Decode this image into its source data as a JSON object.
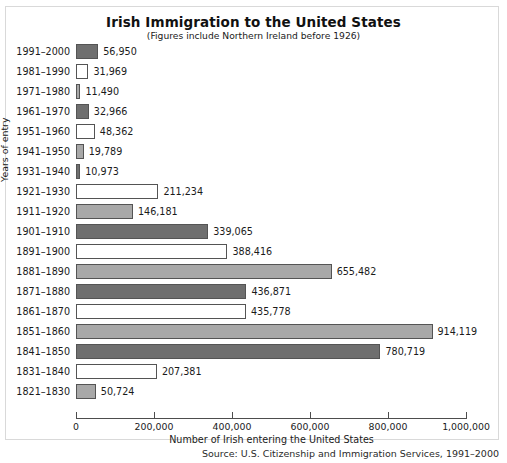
{
  "chart_data": {
    "type": "bar",
    "orientation": "horizontal",
    "title": "Irish Immigration to the United States",
    "subtitle": "(Figures include Northern Ireland before 1926)",
    "xlabel": "Number of Irish entering the United States",
    "ylabel": "Years of entry",
    "xlim": [
      0,
      1000000
    ],
    "grid": false,
    "legend": "none",
    "xticks": [
      0,
      200000,
      400000,
      600000,
      800000,
      1000000
    ],
    "xtick_labels": [
      "0",
      "200,000",
      "400,000",
      "600,000",
      "800,000",
      "1,000,000"
    ],
    "categories": [
      "1991–2000",
      "1981–1990",
      "1971–1980",
      "1961–1970",
      "1951–1960",
      "1941–1950",
      "1931–1940",
      "1921–1930",
      "1911–1920",
      "1901–1910",
      "1891–1900",
      "1881–1890",
      "1871–1880",
      "1861–1870",
      "1851–1860",
      "1841–1850",
      "1831–1840",
      "1821–1830"
    ],
    "values": [
      56950,
      31969,
      11490,
      32966,
      48362,
      19789,
      10973,
      211234,
      146181,
      339065,
      388416,
      655482,
      436871,
      435778,
      914119,
      780719,
      207381,
      50724
    ],
    "value_labels": [
      "56,950",
      "31,969",
      "11,490",
      "32,966",
      "48,362",
      "19,789",
      "10,973",
      "211,234",
      "146,181",
      "339,065",
      "388,416",
      "655,482",
      "436,871",
      "435,778",
      "914,119",
      "780,719",
      "207,381",
      "50,724"
    ],
    "bar_colors": [
      "#6f6f6f",
      "#ffffff",
      "#a8a8a8",
      "#6f6f6f",
      "#ffffff",
      "#a8a8a8",
      "#6f6f6f",
      "#ffffff",
      "#a8a8a8",
      "#6f6f6f",
      "#ffffff",
      "#a8a8a8",
      "#6f6f6f",
      "#ffffff",
      "#a8a8a8",
      "#6f6f6f",
      "#ffffff",
      "#a8a8a8"
    ],
    "bar_edge_color": "#545454",
    "palette": {
      "dark_gray": "#6f6f6f",
      "white": "#ffffff",
      "light_gray": "#a8a8a8",
      "axis": "#4d4d4d",
      "frame": "#d9d9d9",
      "text": "#1a1a1a",
      "background": "#ffffff"
    }
  },
  "source": {
    "caption": "Source: U.S. Citizenship and Immigration Services, 1991–2000"
  }
}
